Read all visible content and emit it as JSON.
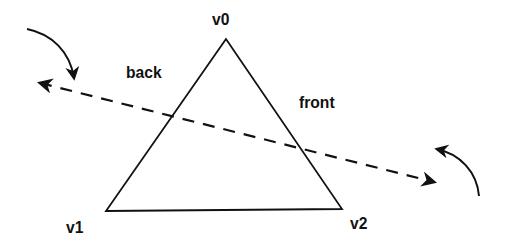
{
  "diagram": {
    "type": "triangle-winding-order",
    "vertices": [
      {
        "id": "v0",
        "label": "v0",
        "x": 226,
        "y": 39
      },
      {
        "id": "v1",
        "label": "v1",
        "x": 106,
        "y": 211
      },
      {
        "id": "v2",
        "label": "v2",
        "x": 342,
        "y": 209
      }
    ],
    "labels": {
      "v0": "v0",
      "v1": "v1",
      "v2": "v2",
      "back": "back",
      "front": "front"
    },
    "axis_line": {
      "style": "dashed",
      "from": [
        36,
        82
      ],
      "to": [
        436,
        182
      ],
      "arrowheads": "both"
    },
    "rotation_arrows": [
      {
        "side": "back",
        "direction": "clockwise-down"
      },
      {
        "side": "front",
        "direction": "counterclockwise-up"
      }
    ],
    "colors": {
      "stroke": "#111111",
      "background": "#ffffff"
    }
  }
}
